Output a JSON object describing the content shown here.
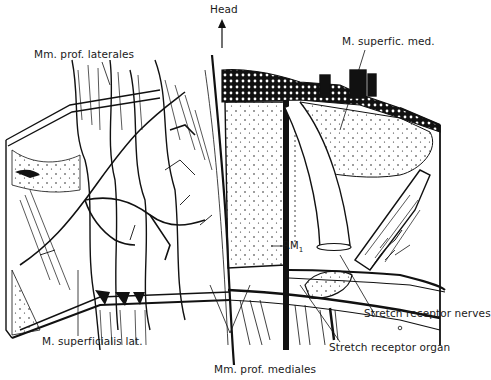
{
  "figure": {
    "type": "anatomical-diagram",
    "colors": {
      "ink": "#111111",
      "background": "#ffffff"
    },
    "orientation": {
      "label": "Head",
      "arrow": "up"
    },
    "labels": {
      "head": "Head",
      "mm_prof_laterales": "Mm. prof. laterales",
      "m_superfic_med": "M. superfic. med.",
      "rm1_prefix": "RM",
      "rm1_sub": "1",
      "stretch_receptor_nerves": "Stretch receptor nerves",
      "stretch_receptor_organ": "Stretch receptor organ",
      "m_superficialis_lat": "M. superficialis lat.",
      "mm_prof_mediales": "Mm. prof. mediales"
    }
  }
}
